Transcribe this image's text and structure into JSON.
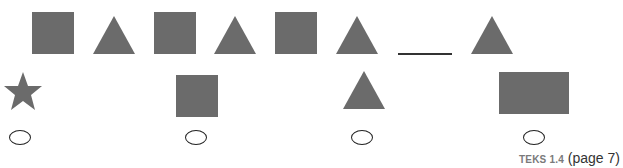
{
  "pattern": {
    "sequence": [
      "square",
      "triangle",
      "square",
      "triangle",
      "square",
      "triangle",
      "blank",
      "triangle"
    ],
    "blank_label": ""
  },
  "answer_choices": [
    {
      "shape": "star",
      "selected": false
    },
    {
      "shape": "square",
      "selected": false
    },
    {
      "shape": "triangle",
      "selected": false
    },
    {
      "shape": "rectangle",
      "selected": false
    }
  ],
  "colors": {
    "shape_fill": "#6b6b6b",
    "text": "#333333",
    "teks_label": "#7a7a7a"
  },
  "footer": {
    "standard": "TEKS 1.4",
    "page_ref": "(page 7)"
  }
}
